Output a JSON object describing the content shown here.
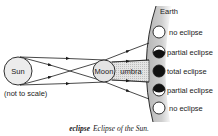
{
  "diagram": {
    "sun_label": "Sun",
    "moon_label": "Moon",
    "umbra_label": "umbra",
    "earth_label": "Earth",
    "note": "(not to scale)",
    "eclipse_types": [
      {
        "label": "no eclipse",
        "state": "none"
      },
      {
        "label": "partial eclipse",
        "state": "partial-top"
      },
      {
        "label": "total eclipse",
        "state": "total"
      },
      {
        "label": "partial eclipse",
        "state": "partial-bottom"
      },
      {
        "label": "no eclipse",
        "state": "none"
      }
    ],
    "colors": {
      "earth_fill": "#c8c8c8",
      "line": "#1a1a1a",
      "body_fill": "#e6e6e6",
      "umbra_fill": "#d9d9d9"
    }
  },
  "caption": {
    "term": "eclipse",
    "description": "Eclipse of the Sun."
  }
}
